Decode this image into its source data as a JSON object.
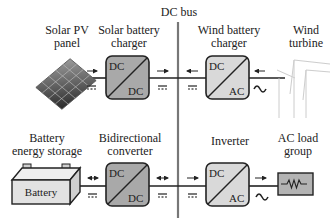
{
  "bus": {
    "label": "DC bus"
  },
  "top_row": {
    "source": {
      "label_line1": "Solar PV",
      "label_line2": "panel",
      "icon": "solar-panel-icon"
    },
    "source_converter": {
      "label_line1": "Solar battery",
      "label_line2": "charger",
      "in": "DC",
      "out": "DC",
      "fill": "#a9a9a9"
    },
    "wind_converter": {
      "label_line1": "Wind battery",
      "label_line2": "charger",
      "in": "DC",
      "out": "AC",
      "fill": "#d9d9d9"
    },
    "wind_source": {
      "label_line1": "Wind",
      "label_line2": "turbine",
      "icon": "wind-turbine-icon"
    },
    "symbols": {
      "dc": "dc-symbol",
      "ac": "ac-tilde-symbol"
    }
  },
  "bottom_row": {
    "storage": {
      "label_line1": "Battery",
      "label_line2": "energy storage",
      "box_label": "Battery",
      "fill": "#e2e2e2"
    },
    "bidirectional": {
      "label_line1": "Bidirectional",
      "label_line2": "converter",
      "in": "DC",
      "out": "DC",
      "fill": "#a9a9a9"
    },
    "inverter": {
      "label_line1": "Inverter",
      "in": "DC",
      "out": "AC",
      "fill": "#d9d9d9"
    },
    "load": {
      "label_line1": "AC load",
      "label_line2": "group",
      "icon": "resistor-icon",
      "fill": "#b3b3b3"
    }
  },
  "colors": {
    "line": "#222222",
    "bus": "#777777",
    "dark_converter": "#a9a9a9",
    "light_converter": "#d9d9d9"
  }
}
